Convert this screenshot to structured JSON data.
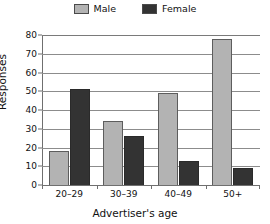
{
  "chart_data": {
    "type": "bar",
    "title": "",
    "xlabel": "Advertiser's age",
    "ylabel": "Responses",
    "categories": [
      "20–29",
      "30–39",
      "40–49",
      "50+"
    ],
    "series": [
      {
        "name": "Male",
        "color": "#b3b3b3",
        "values": [
          18,
          34,
          49,
          78
        ]
      },
      {
        "name": "Female",
        "color": "#333333",
        "values": [
          51,
          26,
          13,
          9
        ]
      }
    ],
    "ylim": [
      0,
      80
    ],
    "yticks": [
      0,
      10,
      20,
      30,
      40,
      50,
      60,
      70,
      80
    ],
    "ytick_labels": [
      "0",
      "10",
      "20",
      "30",
      "40",
      "50",
      "60",
      "70",
      "80"
    ],
    "grid": "horizontal",
    "legend_position": "top-center"
  },
  "legend": {
    "items": [
      {
        "label": "Male",
        "swatch_color": "#b3b3b3"
      },
      {
        "label": "Female",
        "swatch_color": "#333333"
      }
    ]
  },
  "axes": {
    "y_title": "Responses",
    "x_title": "Advertiser's age"
  }
}
